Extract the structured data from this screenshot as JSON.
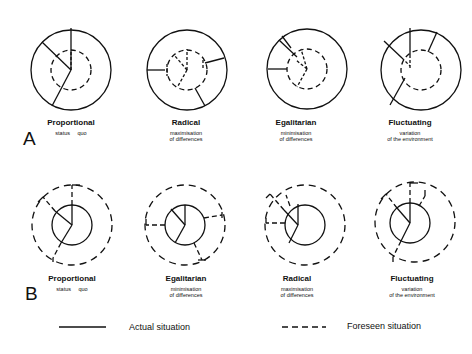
{
  "panels": [
    {
      "letter": "A",
      "diagrams": [
        {
          "title": "Proportional",
          "sub1": "status quo",
          "sub2": "",
          "cx": 71,
          "cy": 70
        },
        {
          "title": "Radical",
          "sub1": "maximisation",
          "sub2": "of differences",
          "cx": 187,
          "cy": 70
        },
        {
          "title": "Egalitarian",
          "sub1": "minimisation",
          "sub2": "of differences",
          "cx": 307,
          "cy": 69
        },
        {
          "title": "Fluctuating",
          "sub1": "variation",
          "sub2": "of the environment",
          "cx": 421,
          "cy": 70
        }
      ]
    },
    {
      "letter": "B",
      "diagrams": [
        {
          "title": "Proportional",
          "sub1": "status quo",
          "sub2": "",
          "cx": 72,
          "cy": 225
        },
        {
          "title": "Egalitarian",
          "sub1": "minimisation",
          "sub2": "of differences",
          "cx": 185,
          "cy": 225
        },
        {
          "title": "Radical",
          "sub1": "maximisation",
          "sub2": "of differences",
          "cx": 305,
          "cy": 225
        },
        {
          "title": "Fluctuating",
          "sub1": "variation",
          "sub2": "of the environment",
          "cx": 420,
          "cy": 225
        }
      ]
    }
  ],
  "legend": {
    "actual": "Actual situation",
    "foreseen": "Foreseen situation"
  },
  "colors": {
    "stroke": "#111111",
    "background": "#ffffff"
  }
}
